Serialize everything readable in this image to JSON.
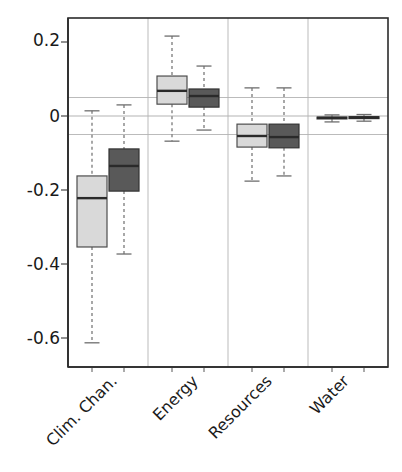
{
  "chart_data": {
    "type": "box",
    "title": "",
    "xlabel": "",
    "ylabel": "",
    "ylim": [
      -0.68,
      0.25
    ],
    "yticks": [
      0.2,
      0,
      -0.2,
      -0.4,
      -0.6
    ],
    "ytick_labels": [
      "0.2",
      "0",
      "-0.2",
      "-0.4",
      "-0.6"
    ],
    "grid": true,
    "gridlines": [
      0.05,
      0,
      -0.05
    ],
    "categories": [
      "Clim. Chan.",
      "Energy",
      "Resources",
      "Water"
    ],
    "legend": [],
    "series": [
      {
        "name": "light",
        "color": "#d9d9d9",
        "edge_color": "#4d4d4d",
        "boxes": [
          {
            "category": "Clim. Chan.",
            "whisker_low": -0.613,
            "q1": -0.354,
            "median": -0.222,
            "q3": -0.162,
            "whisker_high": 0.014
          },
          {
            "category": "Energy",
            "whisker_low": -0.068,
            "q1": 0.032,
            "median": 0.068,
            "q3": 0.108,
            "whisker_high": 0.216
          },
          {
            "category": "Resources",
            "whisker_low": -0.176,
            "q1": -0.084,
            "median": -0.054,
            "q3": -0.022,
            "whisker_high": 0.076
          },
          {
            "category": "Water",
            "whisker_low": -0.016,
            "q1": -0.008,
            "median": -0.005,
            "q3": -0.003,
            "whisker_high": 0.003
          }
        ]
      },
      {
        "name": "dark",
        "color": "#595959",
        "edge_color": "#333333",
        "boxes": [
          {
            "category": "Clim. Chan.",
            "whisker_low": -0.373,
            "q1": -0.203,
            "median": -0.135,
            "q3": -0.089,
            "whisker_high": 0.03
          },
          {
            "category": "Energy",
            "whisker_low": -0.038,
            "q1": 0.024,
            "median": 0.054,
            "q3": 0.073,
            "whisker_high": 0.135
          },
          {
            "category": "Resources",
            "whisker_low": -0.162,
            "q1": -0.086,
            "median": -0.057,
            "q3": -0.022,
            "whisker_high": 0.076
          },
          {
            "category": "Water",
            "whisker_low": -0.014,
            "q1": -0.007,
            "median": -0.004,
            "q3": -0.002,
            "whisker_high": 0.004
          }
        ]
      }
    ]
  },
  "axis": {
    "y_tick_0": "0.2",
    "y_tick_1": "0",
    "y_tick_2": "-0.2",
    "y_tick_3": "-0.4",
    "y_tick_4": "-0.6",
    "cat_0": "Clim. Chan.",
    "cat_1": "Energy",
    "cat_2": "Resources",
    "cat_3": "Water"
  },
  "colors": {
    "light_fill": "#d9d9d9",
    "dark_fill": "#595959",
    "box_edge": "#4a4a4a",
    "panel_border": "#2b2b2b",
    "gridline": "#b3b3b3",
    "whisker": "#6e6e6e"
  }
}
